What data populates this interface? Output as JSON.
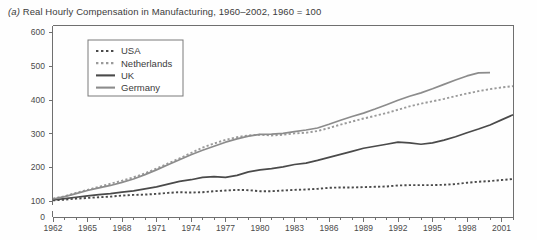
{
  "figure": {
    "label": "(a)",
    "title": "Real Hourly Compensation in Manufacturing, 1960–2002, 1960 = 100"
  },
  "chart_data": {
    "type": "line",
    "title": "(a) Real Hourly Compensation in Manufacturing, 1960–2002, 1960 = 100",
    "xlabel": "",
    "ylabel": "",
    "xlim": [
      1962,
      2002
    ],
    "ylim": [
      100,
      600
    ],
    "yticks": [
      100,
      200,
      300,
      400,
      500,
      600
    ],
    "xticks": [
      1962,
      1965,
      1968,
      1971,
      1974,
      1977,
      1980,
      1983,
      1986,
      1989,
      1992,
      1995,
      1998,
      2001
    ],
    "xtick_labels": [
      "1962",
      "1965",
      "1968",
      "1971",
      "1974",
      "1977",
      "1980",
      "1983",
      "1986",
      "1989",
      "1992",
      "1995",
      "1998",
      "2001"
    ],
    "ytick_labels": [
      "100",
      "200",
      "300",
      "400",
      "500",
      "600"
    ],
    "axis_origin_label": "0",
    "grid": false,
    "legend_position": "top-left-inside",
    "x": [
      1962,
      1963,
      1964,
      1965,
      1966,
      1967,
      1968,
      1969,
      1970,
      1971,
      1972,
      1973,
      1974,
      1975,
      1976,
      1977,
      1978,
      1979,
      1980,
      1981,
      1982,
      1983,
      1984,
      1985,
      1986,
      1987,
      1988,
      1989,
      1990,
      1991,
      1992,
      1993,
      1994,
      1995,
      1996,
      1997,
      1998,
      1999,
      2000,
      2001,
      2002
    ],
    "series": [
      {
        "name": "USA",
        "style": "dotted",
        "color": "#4a4a4a",
        "values": [
          102,
          104,
          107,
          109,
          111,
          113,
          116,
          118,
          119,
          121,
          124,
          126,
          125,
          126,
          129,
          131,
          133,
          132,
          129,
          129,
          131,
          133,
          134,
          136,
          139,
          140,
          140,
          141,
          142,
          143,
          146,
          147,
          147,
          147,
          148,
          150,
          154,
          157,
          159,
          162,
          165
        ]
      },
      {
        "name": "Netherlands",
        "style": "dotted",
        "color": "#9a9a9a",
        "values": [
          107,
          114,
          124,
          133,
          142,
          151,
          160,
          170,
          182,
          196,
          211,
          226,
          242,
          258,
          270,
          281,
          289,
          294,
          296,
          294,
          296,
          300,
          302,
          307,
          316,
          326,
          335,
          344,
          352,
          360,
          370,
          380,
          388,
          395,
          402,
          410,
          418,
          425,
          431,
          436,
          440
        ]
      },
      {
        "name": "UK",
        "style": "solid",
        "color": "#4a4a4a",
        "values": [
          103,
          107,
          111,
          115,
          119,
          122,
          126,
          130,
          136,
          142,
          150,
          158,
          163,
          170,
          172,
          170,
          176,
          186,
          192,
          196,
          201,
          208,
          212,
          220,
          229,
          238,
          247,
          256,
          262,
          268,
          274,
          272,
          268,
          272,
          280,
          290,
          302,
          313,
          325,
          340,
          355
        ]
      },
      {
        "name": "Germany",
        "style": "solid",
        "color": "#8c8c8c",
        "values": [
          106,
          113,
          122,
          131,
          139,
          146,
          155,
          165,
          178,
          192,
          207,
          222,
          237,
          250,
          262,
          274,
          284,
          292,
          297,
          298,
          300,
          305,
          310,
          316,
          327,
          339,
          350,
          360,
          372,
          385,
          398,
          410,
          420,
          432,
          445,
          458,
          470,
          479,
          480,
          null,
          null
        ]
      }
    ]
  },
  "legend": {
    "entries": [
      {
        "label": "USA"
      },
      {
        "label": "Netherlands"
      },
      {
        "label": "UK"
      },
      {
        "label": "Germany"
      }
    ]
  }
}
